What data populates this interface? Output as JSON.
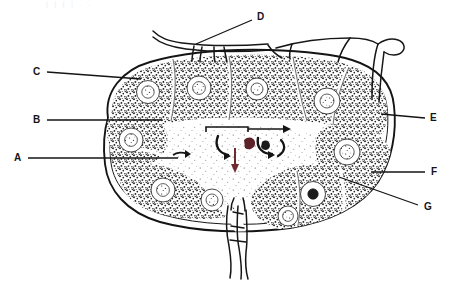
{
  "figure": {
    "view": "sectional-line-drawing",
    "ink_color": "#1a1a1a",
    "paper_color": "#ffffff",
    "stipple_color": "#232323",
    "accent_red": "#7d2b32",
    "top_cropped_text": "|      |        |       |    . ."
  },
  "labels": [
    {
      "id": "A",
      "text": "A",
      "x": 14,
      "y": 158,
      "side": "left"
    },
    {
      "id": "B",
      "text": "B",
      "x": 33,
      "y": 120,
      "side": "left"
    },
    {
      "id": "C",
      "text": "C",
      "x": 33,
      "y": 72,
      "side": "left"
    },
    {
      "id": "D",
      "text": "D",
      "x": 257,
      "y": 17,
      "side": "top"
    },
    {
      "id": "E",
      "text": "E",
      "x": 430,
      "y": 118,
      "side": "right"
    },
    {
      "id": "F",
      "text": "F",
      "x": 431,
      "y": 172,
      "side": "right"
    },
    {
      "id": "G",
      "text": "G",
      "x": 424,
      "y": 207,
      "side": "right"
    }
  ],
  "leader_lines": [
    {
      "for": "A",
      "x1": 28,
      "y1": 158,
      "x2": 178,
      "y2": 158
    },
    {
      "for": "B",
      "x1": 47,
      "y1": 120,
      "x2": 160,
      "y2": 120
    },
    {
      "for": "C",
      "x1": 47,
      "y1": 72,
      "x2": 140,
      "y2": 79
    },
    {
      "for": "D",
      "x1": 252,
      "y1": 20,
      "x2": 196,
      "y2": 44
    },
    {
      "for": "E",
      "x1": 425,
      "y1": 118,
      "x2": 382,
      "y2": 115
    },
    {
      "for": "F",
      "x1": 425,
      "y1": 172,
      "x2": 372,
      "y2": 172
    },
    {
      "for": "G",
      "x1": 418,
      "y1": 205,
      "x2": 340,
      "y2": 178
    }
  ],
  "structures": {
    "capsule": "outer capsule outline",
    "cortex": "stippled outer cortex band",
    "follicles": "lymphoid follicles with pale germinal centers",
    "medulla": "pale central medullary region",
    "trabeculae": "connective tissue trabeculae",
    "afferent_vessels": "afferent lymphatic vessels at top",
    "efferent_vessels": "efferent vessels at hilum (bottom)",
    "flow_arrows": "arrows indicating lymph flow through sinuses"
  },
  "germinal_centers": [
    {
      "cx": 148,
      "cy": 92,
      "r": 10
    },
    {
      "cx": 199,
      "cy": 88,
      "r": 11
    },
    {
      "cx": 257,
      "cy": 89,
      "r": 10
    },
    {
      "cx": 325,
      "cy": 101,
      "r": 12
    },
    {
      "cx": 131,
      "cy": 140,
      "r": 11
    },
    {
      "cx": 345,
      "cy": 152,
      "r": 12
    },
    {
      "cx": 163,
      "cy": 190,
      "r": 11
    },
    {
      "cx": 211,
      "cy": 199,
      "r": 10
    },
    {
      "cx": 285,
      "cy": 197,
      "r": 11
    },
    {
      "cx": 297,
      "cy": 213,
      "r": 9
    }
  ]
}
